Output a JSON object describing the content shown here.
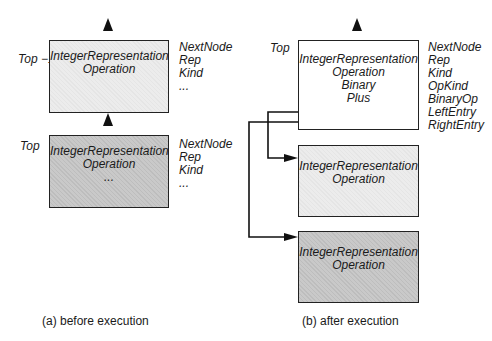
{
  "diagram": {
    "before": {
      "caption": "(a)  before execution",
      "top_minus_1": {
        "stack_label": "Top −1",
        "box_lines": [
          "IntegerRepresentation",
          "Operation"
        ],
        "fields": [
          "NextNode",
          "Rep",
          "Kind",
          "..."
        ],
        "fill": "#ececec"
      },
      "top": {
        "stack_label": "Top",
        "box_lines": [
          "IntegerRepresentation",
          "Operation",
          "..."
        ],
        "fields": [
          "NextNode",
          "Rep",
          "Kind",
          "..."
        ],
        "fill": "#c9c9c9"
      }
    },
    "after": {
      "caption": "(b)  after execution",
      "top": {
        "stack_label": "Top",
        "box_lines": [
          "IntegerRepresentation",
          "Operation",
          "Binary",
          "Plus"
        ],
        "fields": [
          "NextNode",
          "Rep",
          "Kind",
          "OpKind",
          "BinaryOp",
          "LeftEntry",
          "RightEntry"
        ],
        "fill": "#ffffff"
      },
      "left_operand": {
        "box_lines": [
          "IntegerRepresentation",
          "Operation"
        ],
        "fill": "#ececec"
      },
      "right_operand": {
        "box_lines": [
          "IntegerRepresentation",
          "Operation"
        ],
        "fill": "#c9c9c9"
      }
    }
  }
}
